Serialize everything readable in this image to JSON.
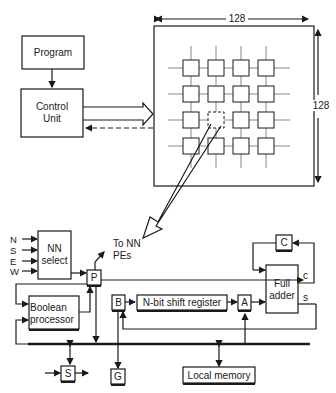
{
  "diagram": {
    "top": {
      "program": "Program",
      "control_unit_line1": "Control",
      "control_unit_line2": "Unit",
      "array_width": "128",
      "array_height": "128",
      "grid_rows": 4,
      "grid_cols": 4,
      "highlighted_pe": {
        "row": 3,
        "col": 2
      }
    },
    "pe": {
      "inputs": [
        "N",
        "S",
        "E",
        "W"
      ],
      "nn_select_line1": "NN",
      "nn_select_line2": "select",
      "to_nn_line1": "To NN",
      "to_nn_line2": "PEs",
      "p_reg": "P",
      "c_reg": "C",
      "b_reg": "B",
      "a_reg": "A",
      "s_reg": "S",
      "g_reg": "G",
      "shift_register": "N-bit shift register",
      "full_adder_line1": "Full",
      "full_adder_line2": "adder",
      "carry_out": "c",
      "sum_out": "s",
      "boolean_line1": "Boolean",
      "boolean_line2": "processor",
      "local_memory": "Local memory"
    }
  }
}
